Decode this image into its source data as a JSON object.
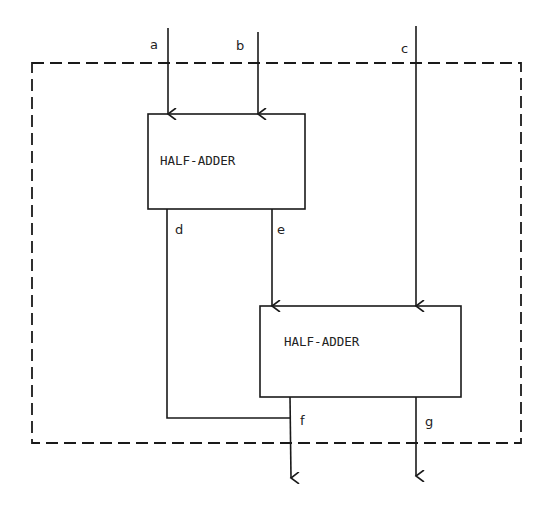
{
  "diagram": {
    "type": "full-adder-from-half-adders",
    "blocks": [
      {
        "id": "ha1",
        "label": "HALF-ADDER"
      },
      {
        "id": "ha2",
        "label": "HALF-ADDER"
      }
    ],
    "signals": {
      "a": "a",
      "b": "b",
      "c": "c",
      "d": "d",
      "e": "e",
      "f": "f",
      "g": "g"
    },
    "colors": {
      "stroke": "#1a1a1a",
      "background": "#ffffff"
    }
  }
}
